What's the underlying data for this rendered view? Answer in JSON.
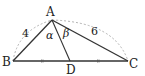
{
  "diagram": {
    "type": "triangle-with-median",
    "vertices": {
      "A": {
        "label": "A",
        "x": 52,
        "y": 20
      },
      "B": {
        "label": "B",
        "x": 13,
        "y": 61
      },
      "C": {
        "label": "C",
        "x": 128,
        "y": 61
      },
      "D": {
        "label": "D",
        "x": 70,
        "y": 61
      }
    },
    "side_lengths": {
      "AB": "4",
      "AC": "6"
    },
    "angles": {
      "BAD": "α",
      "DAC": "β"
    },
    "equal_marks": [
      "BD",
      "DC"
    ],
    "colors": {
      "stroke": "#333333",
      "dashed": "#aaaaaa",
      "background": "#ffffff"
    }
  }
}
